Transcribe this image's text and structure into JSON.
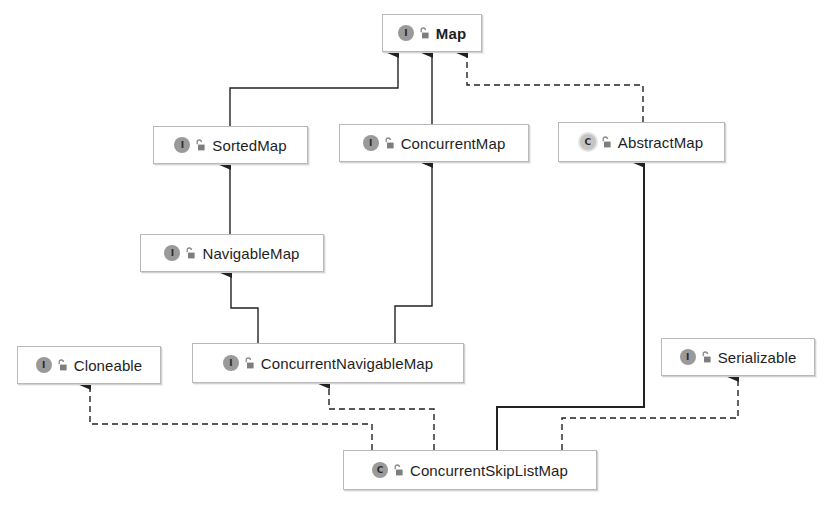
{
  "diagram": {
    "canvas": {
      "width": 831,
      "height": 507,
      "background": "#ffffff"
    },
    "colors": {
      "edge": "#222222",
      "node_border": "#b9b9b9",
      "badge_fill": "#9a9a9a",
      "text": "#1e1e1e"
    },
    "legend_kinds": {
      "I": "interface",
      "C": "class",
      "C-abstract": "abstract class"
    },
    "nodes": [
      {
        "id": "map",
        "label": "Map",
        "kind": "I",
        "kind_type": "interface",
        "access_icon": "lock-open-icon",
        "box": {
          "x": 382,
          "y": 14,
          "w": 100,
          "h": 38
        }
      },
      {
        "id": "sortedmap",
        "label": "SortedMap",
        "kind": "I",
        "kind_type": "interface",
        "access_icon": "lock-open-icon",
        "box": {
          "x": 153,
          "y": 126,
          "w": 155,
          "h": 38
        }
      },
      {
        "id": "concurrentmap",
        "label": "ConcurrentMap",
        "kind": "I",
        "kind_type": "interface",
        "access_icon": "lock-open-icon",
        "box": {
          "x": 339,
          "y": 124,
          "w": 190,
          "h": 38
        }
      },
      {
        "id": "abstractmap",
        "label": "AbstractMap",
        "kind": "C",
        "kind_type": "abstract class",
        "access_icon": "lock-open-icon",
        "box": {
          "x": 558,
          "y": 122,
          "w": 167,
          "h": 40
        }
      },
      {
        "id": "navigablemap",
        "label": "NavigableMap",
        "kind": "I",
        "kind_type": "interface",
        "access_icon": "lock-open-icon",
        "box": {
          "x": 140,
          "y": 234,
          "w": 184,
          "h": 38
        }
      },
      {
        "id": "cloneable",
        "label": "Cloneable",
        "kind": "I",
        "kind_type": "interface",
        "access_icon": "lock-open-icon",
        "box": {
          "x": 17,
          "y": 346,
          "w": 144,
          "h": 38
        }
      },
      {
        "id": "concurrentnavigablemap",
        "label": "ConcurrentNavigableMap",
        "kind": "I",
        "kind_type": "interface",
        "access_icon": "lock-open-icon",
        "box": {
          "x": 192,
          "y": 343,
          "w": 272,
          "h": 40
        }
      },
      {
        "id": "serializable",
        "label": "Serializable",
        "kind": "I",
        "kind_type": "interface",
        "access_icon": "lock-open-icon",
        "box": {
          "x": 661,
          "y": 338,
          "w": 154,
          "h": 38
        }
      },
      {
        "id": "concurrentskiplistmap",
        "label": "ConcurrentSkipListMap",
        "kind": "C",
        "kind_type": "class",
        "access_icon": "lock-open-icon",
        "box": {
          "x": 343,
          "y": 450,
          "w": 254,
          "h": 40
        }
      }
    ],
    "edges": [
      {
        "from": "sortedmap",
        "to": "map",
        "style": "solid",
        "relation": "extends",
        "points": [
          [
            230,
            126
          ],
          [
            230,
            88
          ],
          [
            398,
            88
          ],
          [
            398,
            52
          ]
        ]
      },
      {
        "from": "concurrentmap",
        "to": "map",
        "style": "solid",
        "relation": "extends",
        "points": [
          [
            432,
            124
          ],
          [
            432,
            52
          ]
        ]
      },
      {
        "from": "abstractmap",
        "to": "map",
        "style": "dashed",
        "relation": "implements",
        "points": [
          [
            643,
            122
          ],
          [
            643,
            85
          ],
          [
            467,
            85
          ],
          [
            467,
            52
          ]
        ]
      },
      {
        "from": "navigablemap",
        "to": "sortedmap",
        "style": "solid",
        "relation": "extends",
        "points": [
          [
            230,
            234
          ],
          [
            230,
            164
          ]
        ]
      },
      {
        "from": "concurrentnavigablemap",
        "to": "navigablemap",
        "style": "solid",
        "relation": "extends",
        "points": [
          [
            258,
            343
          ],
          [
            258,
            308
          ],
          [
            231,
            308
          ],
          [
            231,
            272
          ]
        ]
      },
      {
        "from": "concurrentnavigablemap",
        "to": "concurrentmap",
        "style": "solid",
        "relation": "extends",
        "points": [
          [
            395,
            343
          ],
          [
            395,
            306
          ],
          [
            432,
            306
          ],
          [
            432,
            162
          ]
        ]
      },
      {
        "from": "concurrentskiplistmap",
        "to": "cloneable",
        "style": "dashed",
        "relation": "implements",
        "points": [
          [
            372,
            450
          ],
          [
            372,
            424
          ],
          [
            90,
            424
          ],
          [
            90,
            384
          ]
        ]
      },
      {
        "from": "concurrentskiplistmap",
        "to": "concurrentnavigablemap",
        "style": "dashed",
        "relation": "implements",
        "points": [
          [
            434,
            450
          ],
          [
            434,
            409
          ],
          [
            329,
            409
          ],
          [
            329,
            383
          ]
        ]
      },
      {
        "from": "concurrentskiplistmap",
        "to": "abstractmap",
        "style": "solid",
        "relation": "extends",
        "points": [
          [
            497,
            450
          ],
          [
            497,
            407
          ],
          [
            644,
            407
          ],
          [
            644,
            162
          ]
        ]
      },
      {
        "from": "concurrentskiplistmap",
        "to": "serializable",
        "style": "dashed",
        "relation": "implements",
        "points": [
          [
            562,
            450
          ],
          [
            562,
            418
          ],
          [
            738,
            418
          ],
          [
            738,
            376
          ]
        ]
      }
    ]
  }
}
